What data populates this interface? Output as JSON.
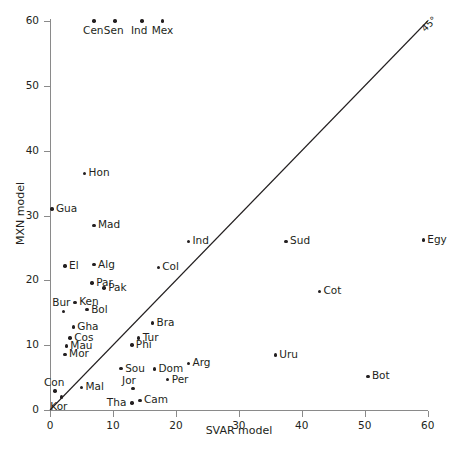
{
  "chart_data": {
    "type": "scatter",
    "title": "",
    "xlabel": "SVAR model",
    "ylabel": "MXN model",
    "xlim": [
      0,
      60
    ],
    "ylim": [
      0,
      60
    ],
    "xticks": [
      0,
      10,
      20,
      30,
      40,
      50,
      60
    ],
    "yticks": [
      0,
      10,
      20,
      30,
      40,
      50,
      60
    ],
    "grid": false,
    "legend": "none",
    "annotations": [
      {
        "name": "diagonal-reference-line",
        "text": "45°",
        "x1": 0,
        "y1": 0,
        "x2": 60,
        "y2": 60
      }
    ],
    "points": [
      {
        "label": "Cen",
        "x": 7.0,
        "y": 60.0,
        "label_pos": "below"
      },
      {
        "label": "Sen",
        "x": 10.3,
        "y": 60.0,
        "label_pos": "below"
      },
      {
        "label": "Ind",
        "x": 14.6,
        "y": 60.0,
        "label_pos": "below"
      },
      {
        "label": "Mex",
        "x": 17.9,
        "y": 60.0,
        "label_pos": "below"
      },
      {
        "label": "Hon",
        "x": 5.5,
        "y": 36.5,
        "label_pos": "right"
      },
      {
        "label": "Gua",
        "x": 0.3,
        "y": 31.0,
        "label_pos": "right"
      },
      {
        "label": "Mad",
        "x": 7.0,
        "y": 28.5,
        "label_pos": "right"
      },
      {
        "label": "Ind",
        "x": 22.0,
        "y": 26.0,
        "label_pos": "right"
      },
      {
        "label": "Sud",
        "x": 37.5,
        "y": 26.0,
        "label_pos": "right"
      },
      {
        "label": "Egy",
        "x": 59.3,
        "y": 26.2,
        "label_pos": "right"
      },
      {
        "label": "El",
        "x": 2.4,
        "y": 22.2,
        "label_pos": "right"
      },
      {
        "label": "Alg",
        "x": 7.0,
        "y": 22.4,
        "label_pos": "right"
      },
      {
        "label": "Col",
        "x": 17.2,
        "y": 22.0,
        "label_pos": "right"
      },
      {
        "label": "Par",
        "x": 6.7,
        "y": 19.6,
        "label_pos": "right"
      },
      {
        "label": "Pak",
        "x": 8.6,
        "y": 18.8,
        "label_pos": "right"
      },
      {
        "label": "Cot",
        "x": 42.8,
        "y": 18.3,
        "label_pos": "right"
      },
      {
        "label": "Ken",
        "x": 4.0,
        "y": 16.6,
        "label_pos": "right"
      },
      {
        "label": "Bol",
        "x": 5.9,
        "y": 15.5,
        "label_pos": "right"
      },
      {
        "label": "Bur",
        "x": 2.1,
        "y": 15.2,
        "label_pos": "above"
      },
      {
        "label": "Bra",
        "x": 16.3,
        "y": 13.4,
        "label_pos": "right"
      },
      {
        "label": "Gha",
        "x": 3.7,
        "y": 12.8,
        "label_pos": "right"
      },
      {
        "label": "Cos",
        "x": 3.2,
        "y": 11.1,
        "label_pos": "right"
      },
      {
        "label": "Tur",
        "x": 14.1,
        "y": 11.1,
        "label_pos": "right"
      },
      {
        "label": "Mau",
        "x": 2.6,
        "y": 9.9,
        "label_pos": "right"
      },
      {
        "label": "Phi",
        "x": 13.0,
        "y": 10.0,
        "label_pos": "right"
      },
      {
        "label": "Mor",
        "x": 2.4,
        "y": 8.6,
        "label_pos": "right"
      },
      {
        "label": "Uru",
        "x": 35.8,
        "y": 8.5,
        "label_pos": "right"
      },
      {
        "label": "Arg",
        "x": 22.0,
        "y": 7.2,
        "label_pos": "right"
      },
      {
        "label": "Sou",
        "x": 11.3,
        "y": 6.4,
        "label_pos": "right"
      },
      {
        "label": "Dom",
        "x": 16.6,
        "y": 6.3,
        "label_pos": "right"
      },
      {
        "label": "Bot",
        "x": 50.5,
        "y": 5.2,
        "label_pos": "right"
      },
      {
        "label": "Per",
        "x": 18.7,
        "y": 4.7,
        "label_pos": "right"
      },
      {
        "label": "Mal",
        "x": 5.0,
        "y": 3.5,
        "label_pos": "right"
      },
      {
        "label": "Jor",
        "x": 13.2,
        "y": 3.3,
        "label_pos": "above"
      },
      {
        "label": "Con",
        "x": 0.8,
        "y": 2.9,
        "label_pos": "above"
      },
      {
        "label": "Kor",
        "x": 1.8,
        "y": 2.0,
        "label_pos": "below"
      },
      {
        "label": "Cam",
        "x": 14.3,
        "y": 1.5,
        "label_pos": "right"
      },
      {
        "label": "Tha",
        "x": 13.0,
        "y": 1.1,
        "label_pos": "left"
      }
    ],
    "colors": {
      "point": "#231f20",
      "axis": "#8a8a8a",
      "line": "#231f20",
      "text": "#231f20",
      "background": "#ffffff"
    }
  }
}
